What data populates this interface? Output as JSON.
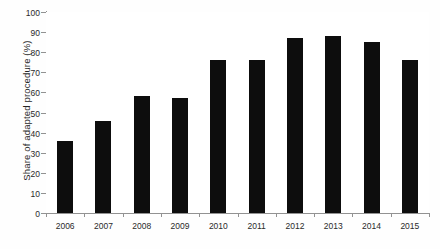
{
  "chart_data": {
    "type": "bar",
    "title": "",
    "xlabel": "",
    "ylabel": "Share of adapted procedure (%)",
    "categories": [
      "2006",
      "2007",
      "2008",
      "2009",
      "2010",
      "2011",
      "2012",
      "2013",
      "2014",
      "2015"
    ],
    "values": [
      36,
      46,
      58,
      57,
      76,
      76,
      87,
      88,
      85,
      76
    ],
    "series": [
      {
        "name": "Share of adapted procedure (%)",
        "values": [
          36,
          46,
          58,
          57,
          76,
          76,
          87,
          88,
          85,
          76
        ]
      }
    ],
    "ylim": [
      0,
      100
    ],
    "y_ticks": [
      0,
      10,
      20,
      30,
      40,
      50,
      60,
      70,
      80,
      90,
      100
    ],
    "y_tick_labels": [
      "0",
      "10",
      "20",
      "30",
      "40",
      "50",
      "60",
      "70",
      "80",
      "90",
      "100"
    ],
    "grid": true,
    "grid_axis": "y",
    "legend": false,
    "legend_position": "none",
    "bar_color": "#050505",
    "axis_color": "#8e8e8e",
    "gridline_color": "#f0f0f2",
    "background_color": "#ffffff"
  }
}
